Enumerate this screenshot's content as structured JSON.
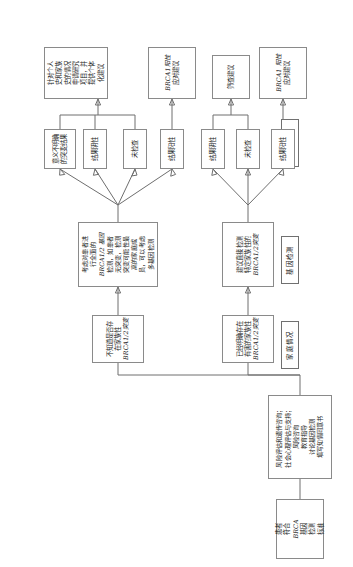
{
  "diagram": {
    "orientation": "rotated-90-ccw",
    "stage_colors": {
      "box_border": "#8a8a8a",
      "header_border": "#707070",
      "connector": "#6e6e6e",
      "background": "#ffffff"
    },
    "stage_labels": [
      {
        "id": "stage-consult",
        "label": "综合征咨询跟进"
      },
      {
        "id": "stage-family",
        "label": "家庭情况"
      },
      {
        "id": "stage-testing",
        "label": "基因检测"
      },
      {
        "id": "stage-results",
        "label": "检测结果"
      },
      {
        "id": "stage-advice",
        "label": "建议"
      }
    ],
    "nodes": {
      "start": {
        "id": "node-start",
        "lines": [
          "患者",
          "符合",
          "BRCA",
          "基因",
          "检测",
          "标准"
        ],
        "italic_lines": [
          2
        ]
      },
      "counseling": {
        "id": "node-counseling",
        "lines": [
          "风险评估和遗传咨询；",
          "社会心理评估与支持；",
          "风险咨询",
          "教育指导",
          "讨论基因检测",
          "填写知情同意书"
        ]
      },
      "family_known": {
        "id": "node-family-known",
        "lines": [
          "已经明确存在",
          "有害的家族性",
          "BRCA1/2突变"
        ],
        "italic_lines": [
          2
        ]
      },
      "family_unknown": {
        "id": "node-family-unknown",
        "lines": [
          "不知道是否存",
          "在家族性",
          "BRCA1/2突变"
        ],
        "italic_lines": [
          2
        ]
      },
      "test_targeted": {
        "id": "node-test-targeted",
        "lines": [
          "建议直接检测",
          "特定家族性的",
          "BRCA1/2突变"
        ],
        "italic_lines": [
          2
        ]
      },
      "test_full": {
        "id": "node-test-full",
        "lines": [
          "考虑对患者进",
          "行全面的",
          "BRCA1/2 基因",
          "检测，如患者",
          "无突变，检测",
          "突变可能性最",
          "高的家庭成",
          "员，可以考虑",
          "多基因检测"
        ],
        "italic_lines": [
          2
        ]
      },
      "result_pos_left": {
        "id": "node-result-positive-left",
        "lines": [
          "结果阳性"
        ]
      },
      "result_none_left": {
        "id": "node-result-untested-left",
        "lines": [
          "未检查"
        ]
      },
      "result_neg_left": {
        "id": "node-result-negative-left",
        "lines": [
          "结果阴性"
        ]
      },
      "result_pos_right": {
        "id": "node-result-positive-right",
        "lines": [
          "结果阳性"
        ]
      },
      "result_none_right": {
        "id": "node-result-untested-right",
        "lines": [
          "未检查"
        ]
      },
      "result_neg_right": {
        "id": "node-result-negative-right",
        "lines": [
          "结果阴性"
        ]
      },
      "result_vus": {
        "id": "node-result-vus",
        "lines": [
          "意义不明确",
          "的突变结果"
        ]
      },
      "advice_pos_left": {
        "id": "node-advice-positive-left",
        "lines": [
          "BRCA1 阳性",
          "应对建议"
        ],
        "italic_lines": [
          0
        ]
      },
      "advice_screen": {
        "id": "node-advice-screening",
        "lines": [
          "筛查建议"
        ]
      },
      "advice_pos_right": {
        "id": "node-advice-positive-right",
        "lines": [
          "BRCA1阳性",
          "应对建议"
        ],
        "italic_lines": [
          0
        ]
      },
      "advice_personal": {
        "id": "node-advice-personalized",
        "lines": [
          "针对个人",
          "史和家族",
          "史的情况",
          "申请研究",
          "项目，并",
          "提供个体",
          "化建议"
        ]
      }
    }
  }
}
